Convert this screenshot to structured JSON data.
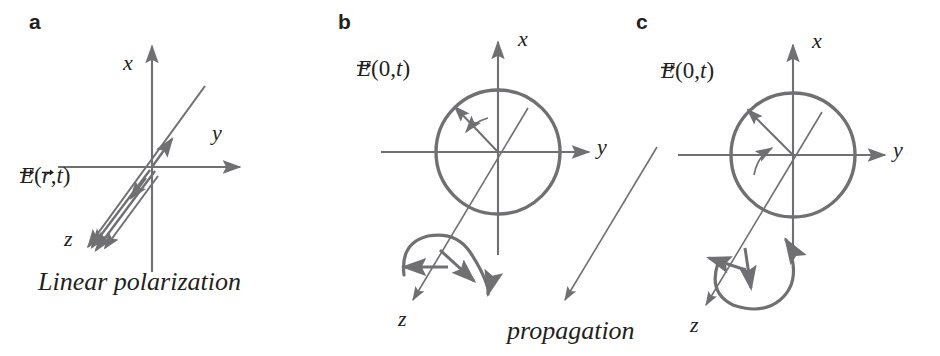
{
  "figure": {
    "background_color": "#ffffff",
    "stroke_color": "#706f72",
    "text_color": "#231f20",
    "width": 940,
    "height": 356
  },
  "panels": [
    {
      "id": "a",
      "letter": "a",
      "kind": "linear-polarization",
      "field_label": {
        "full": "E(r,t)",
        "symbol": "E",
        "arg1": "r",
        "arg2": "t",
        "comma": ",",
        "open": "(",
        "close": ")",
        "vector_overbar": true
      },
      "axes": [
        {
          "name": "x",
          "label": "x"
        },
        {
          "name": "y",
          "label": "y"
        },
        {
          "name": "z",
          "label": "z"
        }
      ],
      "caption": "Linear polarization",
      "has_circle": false,
      "oscillation": "double-headed arrow along a fixed line through the origin"
    },
    {
      "id": "b",
      "letter": "b",
      "kind": "circular-polarization-clockwise",
      "field_label": {
        "full": "E(0,t)",
        "symbol": "E",
        "arg1": "0",
        "arg2": "t",
        "comma": ",",
        "open": "(",
        "close": ")",
        "vector_overbar": true
      },
      "axes": [
        {
          "name": "x",
          "label": "x"
        },
        {
          "name": "y",
          "label": "y"
        },
        {
          "name": "z",
          "label": "z"
        }
      ],
      "caption": "",
      "has_circle": true,
      "rotation_sense": "clockwise",
      "helix": "upward arch loop"
    },
    {
      "id": "c",
      "letter": "c",
      "kind": "circular-polarization-counterclockwise",
      "field_label": {
        "full": "E(0,t)",
        "symbol": "E",
        "arg1": "0",
        "arg2": "t",
        "comma": ",",
        "open": "(",
        "close": ")",
        "vector_overbar": true
      },
      "axes": [
        {
          "name": "x",
          "label": "x"
        },
        {
          "name": "y",
          "label": "y"
        },
        {
          "name": "z",
          "label": "z"
        }
      ],
      "caption": "",
      "has_circle": true,
      "rotation_sense": "counterclockwise",
      "helix": "downward loop"
    }
  ],
  "propagation": {
    "label": "propagation",
    "direction": "down-left arrow between panels b and c"
  }
}
